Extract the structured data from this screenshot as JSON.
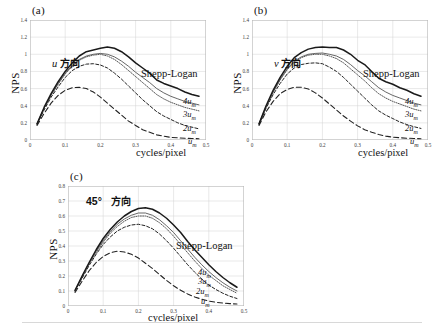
{
  "figure": {
    "ylabel": "NPS",
    "xlabel": "cycles/pixel",
    "shepp_logan_label": "Shepp-Logan",
    "curve_labels": {
      "four": "4u",
      "three": "3u",
      "two": "2u",
      "one": "u",
      "subscript": "m"
    }
  },
  "panels": [
    {
      "tag": "(a)",
      "direction_symbol": "u",
      "direction_word": "方向",
      "ylabel": "NPS",
      "xlabel": "cycles/pixel",
      "yticks": [
        "0",
        "0.2",
        "0.4",
        "0.6",
        "0.8",
        "1",
        "1.2",
        "1.4"
      ],
      "xticks": [
        "0",
        "0.1",
        "0.2",
        "0.3",
        "0.4",
        "0.5"
      ]
    },
    {
      "tag": "(b)",
      "direction_symbol": "v",
      "direction_word": "方向",
      "ylabel": "NPS",
      "xlabel": "cycles/pixel",
      "yticks": [
        "0",
        "0.2",
        "0.4",
        "0.6",
        "0.8",
        "1",
        "1.2",
        "1.4"
      ],
      "xticks": [
        "0",
        "0.1",
        "0.2",
        "0.3",
        "0.4",
        "0.5"
      ]
    },
    {
      "tag": "(c)",
      "direction_symbol": "45°",
      "direction_word": "方向",
      "ylabel": "NPS",
      "xlabel": "cycles/pixel",
      "yticks": [
        "0",
        "0.1",
        "0.2",
        "0.3",
        "0.4",
        "0.5",
        "0.6",
        "0.7",
        "0.8"
      ],
      "xticks": [
        "0",
        "0.1",
        "0.2",
        "0.3",
        "0.4",
        "0.5"
      ]
    }
  ],
  "chart_data": [
    {
      "type": "line",
      "panel": "(a)",
      "title": "u 方向",
      "xlabel": "cycles/pixel",
      "ylabel": "NPS",
      "xlim": [
        0,
        0.5
      ],
      "ylim": [
        0,
        1.4
      ],
      "yticks": [
        0,
        0.2,
        0.4,
        0.6,
        0.8,
        1.0,
        1.2,
        1.4
      ],
      "xticks": [
        0,
        0.1,
        0.2,
        0.3,
        0.4,
        0.5
      ],
      "grid": true,
      "legend": "in-plot annotations at right end of each curve",
      "x": [
        0.02,
        0.04,
        0.06,
        0.08,
        0.1,
        0.12,
        0.14,
        0.16,
        0.18,
        0.2,
        0.22,
        0.24,
        0.26,
        0.28,
        0.3,
        0.32,
        0.34,
        0.36,
        0.38,
        0.4,
        0.42,
        0.44,
        0.46,
        0.48
      ],
      "series": [
        {
          "name": "Shepp-Logan",
          "style": "solid-thick",
          "values": [
            0.19,
            0.38,
            0.54,
            0.68,
            0.8,
            0.9,
            0.98,
            1.03,
            1.05,
            1.07,
            1.085,
            1.07,
            1.03,
            0.97,
            0.9,
            0.84,
            0.78,
            0.7,
            0.66,
            0.63,
            0.6,
            0.56,
            0.53,
            0.51
          ]
        },
        {
          "name": "4u_m",
          "style": "solid-thin",
          "values": [
            0.19,
            0.37,
            0.53,
            0.66,
            0.78,
            0.87,
            0.94,
            0.98,
            1.0,
            1.01,
            1.0,
            0.97,
            0.92,
            0.86,
            0.79,
            0.73,
            0.67,
            0.6,
            0.55,
            0.51,
            0.48,
            0.45,
            0.43,
            0.41
          ]
        },
        {
          "name": "3u_m",
          "style": "dotted",
          "values": [
            0.19,
            0.37,
            0.52,
            0.65,
            0.77,
            0.86,
            0.93,
            0.97,
            0.99,
            1.0,
            0.98,
            0.94,
            0.88,
            0.81,
            0.74,
            0.67,
            0.6,
            0.53,
            0.48,
            0.44,
            0.41,
            0.38,
            0.36,
            0.34
          ]
        },
        {
          "name": "2u_m",
          "style": "dashed-short",
          "values": [
            0.18,
            0.35,
            0.5,
            0.62,
            0.73,
            0.81,
            0.86,
            0.885,
            0.89,
            0.875,
            0.84,
            0.78,
            0.71,
            0.63,
            0.55,
            0.47,
            0.4,
            0.33,
            0.28,
            0.24,
            0.2,
            0.17,
            0.15,
            0.13
          ]
        },
        {
          "name": "u_m",
          "style": "dashed-long",
          "values": [
            0.17,
            0.31,
            0.43,
            0.52,
            0.58,
            0.61,
            0.615,
            0.6,
            0.56,
            0.5,
            0.43,
            0.36,
            0.29,
            0.22,
            0.17,
            0.12,
            0.09,
            0.06,
            0.045,
            0.03,
            0.025,
            0.02,
            0.018,
            0.015
          ]
        }
      ]
    },
    {
      "type": "line",
      "panel": "(b)",
      "title": "v 方向",
      "xlabel": "cycles/pixel",
      "ylabel": "NPS",
      "xlim": [
        0,
        0.5
      ],
      "ylim": [
        0,
        1.4
      ],
      "yticks": [
        0,
        0.2,
        0.4,
        0.6,
        0.8,
        1.0,
        1.2,
        1.4
      ],
      "xticks": [
        0,
        0.1,
        0.2,
        0.3,
        0.4,
        0.5
      ],
      "grid": true,
      "x": [
        0.02,
        0.04,
        0.06,
        0.08,
        0.1,
        0.12,
        0.14,
        0.16,
        0.18,
        0.2,
        0.22,
        0.24,
        0.26,
        0.28,
        0.3,
        0.32,
        0.34,
        0.36,
        0.38,
        0.4,
        0.42,
        0.44,
        0.46,
        0.48
      ],
      "series": [
        {
          "name": "Shepp-Logan",
          "style": "solid-thick",
          "values": [
            0.19,
            0.4,
            0.58,
            0.73,
            0.86,
            0.96,
            1.02,
            1.06,
            1.08,
            1.085,
            1.08,
            1.08,
            1.05,
            1.0,
            0.93,
            0.88,
            0.8,
            0.72,
            0.68,
            0.65,
            0.61,
            0.58,
            0.54,
            0.51
          ]
        },
        {
          "name": "4u_m",
          "style": "solid-thin",
          "values": [
            0.19,
            0.39,
            0.56,
            0.71,
            0.83,
            0.92,
            0.97,
            1.0,
            1.01,
            1.015,
            1.0,
            0.98,
            0.94,
            0.88,
            0.81,
            0.75,
            0.68,
            0.61,
            0.56,
            0.52,
            0.49,
            0.46,
            0.43,
            0.41
          ]
        },
        {
          "name": "3u_m",
          "style": "dotted",
          "values": [
            0.19,
            0.385,
            0.555,
            0.7,
            0.82,
            0.91,
            0.96,
            0.99,
            1.0,
            1.0,
            0.98,
            0.95,
            0.9,
            0.83,
            0.76,
            0.69,
            0.61,
            0.54,
            0.49,
            0.45,
            0.42,
            0.39,
            0.36,
            0.34
          ]
        },
        {
          "name": "2u_m",
          "style": "dashed-short",
          "values": [
            0.18,
            0.37,
            0.53,
            0.66,
            0.77,
            0.84,
            0.88,
            0.895,
            0.9,
            0.89,
            0.85,
            0.8,
            0.73,
            0.65,
            0.57,
            0.49,
            0.41,
            0.34,
            0.29,
            0.25,
            0.21,
            0.18,
            0.155,
            0.135
          ]
        },
        {
          "name": "u_m",
          "style": "dashed-long",
          "values": [
            0.17,
            0.33,
            0.45,
            0.54,
            0.59,
            0.615,
            0.615,
            0.595,
            0.55,
            0.49,
            0.42,
            0.35,
            0.28,
            0.22,
            0.165,
            0.12,
            0.09,
            0.065,
            0.045,
            0.033,
            0.026,
            0.021,
            0.018,
            0.015
          ]
        }
      ]
    },
    {
      "type": "line",
      "panel": "(c)",
      "title": "45° 方向",
      "xlabel": "cycles/pixel",
      "ylabel": "NPS",
      "xlim": [
        0,
        0.5
      ],
      "ylim": [
        0,
        0.8
      ],
      "yticks": [
        0,
        0.1,
        0.2,
        0.3,
        0.4,
        0.5,
        0.6,
        0.7,
        0.8
      ],
      "xticks": [
        0,
        0.1,
        0.2,
        0.3,
        0.4,
        0.5
      ],
      "grid": true,
      "x": [
        0.02,
        0.04,
        0.06,
        0.08,
        0.1,
        0.12,
        0.14,
        0.16,
        0.18,
        0.2,
        0.22,
        0.24,
        0.26,
        0.28,
        0.3,
        0.32,
        0.34,
        0.36,
        0.38,
        0.4,
        0.42,
        0.44,
        0.46,
        0.48
      ],
      "series": [
        {
          "name": "Shepp-Logan",
          "style": "solid-thick",
          "values": [
            0.105,
            0.2,
            0.29,
            0.375,
            0.45,
            0.51,
            0.56,
            0.6,
            0.63,
            0.65,
            0.655,
            0.645,
            0.62,
            0.585,
            0.54,
            0.49,
            0.43,
            0.375,
            0.325,
            0.275,
            0.23,
            0.19,
            0.155,
            0.125
          ]
        },
        {
          "name": "4u_m",
          "style": "solid-thin",
          "values": [
            0.105,
            0.195,
            0.285,
            0.365,
            0.435,
            0.495,
            0.545,
            0.58,
            0.605,
            0.62,
            0.62,
            0.605,
            0.575,
            0.535,
            0.49,
            0.435,
            0.38,
            0.325,
            0.275,
            0.23,
            0.19,
            0.155,
            0.125,
            0.1
          ]
        },
        {
          "name": "3u_m",
          "style": "dotted",
          "values": [
            0.1,
            0.19,
            0.28,
            0.355,
            0.425,
            0.485,
            0.53,
            0.565,
            0.59,
            0.6,
            0.6,
            0.585,
            0.555,
            0.515,
            0.465,
            0.41,
            0.355,
            0.3,
            0.25,
            0.205,
            0.17,
            0.135,
            0.11,
            0.085
          ]
        },
        {
          "name": "2u_m",
          "style": "dashed-short",
          "values": [
            0.1,
            0.185,
            0.27,
            0.345,
            0.41,
            0.46,
            0.5,
            0.525,
            0.54,
            0.545,
            0.535,
            0.515,
            0.48,
            0.435,
            0.385,
            0.33,
            0.275,
            0.225,
            0.18,
            0.14,
            0.11,
            0.085,
            0.065,
            0.05
          ]
        },
        {
          "name": "u_m",
          "style": "dashed-long",
          "values": [
            0.09,
            0.165,
            0.235,
            0.29,
            0.33,
            0.355,
            0.365,
            0.36,
            0.345,
            0.32,
            0.285,
            0.25,
            0.21,
            0.17,
            0.135,
            0.105,
            0.08,
            0.06,
            0.045,
            0.033,
            0.025,
            0.02,
            0.016,
            0.013
          ]
        }
      ]
    }
  ]
}
